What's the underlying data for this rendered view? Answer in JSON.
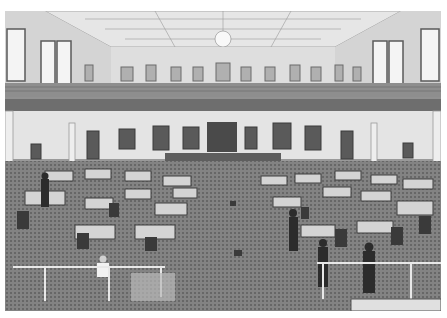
{
  "photo": {
    "subject": "legislative chamber interior",
    "style": "grayscale photograph",
    "colors": {
      "ceiling": "#e8e8e8",
      "walls": "#dcdcdc",
      "balcony": "#6e6e6e",
      "carpet": "#7d7d7d",
      "desk": "#5a5a5a",
      "border": "#ffffff"
    }
  }
}
